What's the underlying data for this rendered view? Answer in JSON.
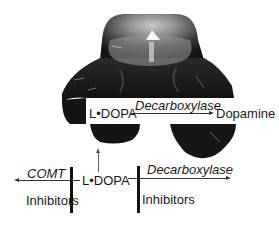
{
  "figure": {
    "brain_image": {
      "description": "grayscale brain cross-section photograph",
      "colors": {
        "dark": "#151515",
        "mid": "#5a5a5a",
        "light": "#a8a8a8",
        "highlight": "#f2f2f2"
      }
    },
    "overlay_reaction": {
      "substrate": "L•DOPA",
      "enzyme": "Decarboxylase",
      "product": "Dopamine"
    },
    "peripheral_pathway": {
      "center": "L•DOPA",
      "left_enzyme": "COMT",
      "right_enzyme": "Decarboxylase",
      "left_inhibitor_label": "Inhibitors",
      "right_inhibitor_label": "Inhibitors"
    }
  }
}
